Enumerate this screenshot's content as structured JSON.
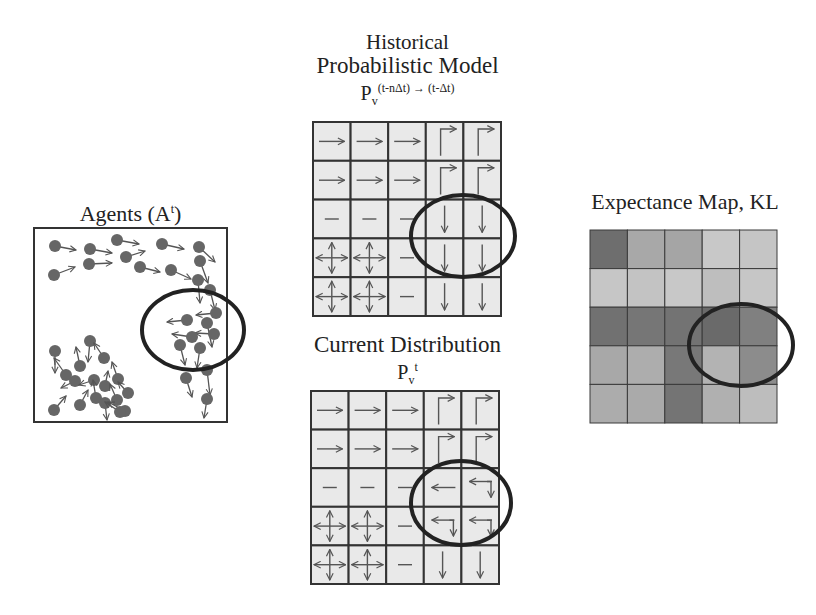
{
  "panels": {
    "agents": {
      "title": "Agents (A",
      "title_sup": "t",
      "title_close": ")"
    },
    "historical": {
      "title_line1": "Historical",
      "title_line2": "Probabilistic Model",
      "symbol": "P",
      "symbol_sub": "v",
      "symbol_sup": "(t-nΔt) → (t-Δt)"
    },
    "current": {
      "title_line1": "Current Distribution",
      "symbol": "P",
      "symbol_sub": "v",
      "symbol_sup": "t"
    },
    "expectance": {
      "title": "Expectance Map, KL"
    }
  },
  "colors": {
    "grid_cell": "#e9e9e9",
    "grid_line": "#333333",
    "arrow": "#555555",
    "agent": "#666666",
    "ellipse": "#222222"
  },
  "historical_grid": [
    [
      "right",
      "right",
      "right",
      "corner-down-right",
      "corner-down-right"
    ],
    [
      "right",
      "right",
      "right",
      "corner-down-right",
      "corner-down-right"
    ],
    [
      "none",
      "none",
      "none",
      "down",
      "down"
    ],
    [
      "all",
      "all",
      "none",
      "down",
      "down"
    ],
    [
      "all",
      "all",
      "none",
      "down",
      "down"
    ]
  ],
  "current_grid": [
    [
      "right",
      "right",
      "right",
      "corner-down-right",
      "corner-down-right"
    ],
    [
      "right",
      "right",
      "right",
      "corner-down-right",
      "corner-down-right"
    ],
    [
      "none",
      "none",
      "none",
      "left",
      "left-down"
    ],
    [
      "all",
      "all",
      "none",
      "left-down",
      "left-down"
    ],
    [
      "all",
      "all",
      "none",
      "down",
      "down"
    ]
  ],
  "kl_map": [
    [
      "#6e6e6e",
      "#a8a8a8",
      "#a5a5a5",
      "#c8c8c8",
      "#c5c5c5"
    ],
    [
      "#c6c6c6",
      "#c3c3c3",
      "#c8c8c8",
      "#bebebe",
      "#c6c6c6"
    ],
    [
      "#717171",
      "#767676",
      "#737373",
      "#6a6a6a",
      "#808080"
    ],
    [
      "#a8a8a8",
      "#adadad",
      "#787878",
      "#b3b3b3",
      "#8c8c8c"
    ],
    [
      "#acacac",
      "#aaaaaa",
      "#747474",
      "#b0b0b0",
      "#bdbdbd"
    ]
  ],
  "agents": [
    [
      55,
      246,
      76,
      250
    ],
    [
      90,
      249,
      112,
      253
    ],
    [
      117,
      240,
      139,
      244
    ],
    [
      162,
      244,
      184,
      249
    ],
    [
      199,
      247,
      215,
      262
    ],
    [
      54,
      275,
      75,
      267
    ],
    [
      89,
      264,
      112,
      263
    ],
    [
      126,
      257,
      145,
      251
    ],
    [
      140,
      267,
      160,
      272
    ],
    [
      171,
      270,
      191,
      279
    ],
    [
      200,
      261,
      208,
      283
    ],
    [
      198,
      280,
      200,
      303
    ],
    [
      210,
      290,
      215,
      310
    ],
    [
      216,
      313,
      196,
      315
    ],
    [
      187,
      320,
      167,
      322
    ],
    [
      207,
      323,
      212,
      347
    ],
    [
      214,
      334,
      195,
      333
    ],
    [
      192,
      337,
      172,
      334
    ],
    [
      180,
      345,
      185,
      365
    ],
    [
      200,
      348,
      197,
      368
    ],
    [
      207,
      370,
      210,
      395
    ],
    [
      186,
      378,
      192,
      397
    ],
    [
      207,
      399,
      204,
      418
    ],
    [
      90,
      341,
      88,
      362
    ],
    [
      55,
      351,
      55,
      373
    ],
    [
      66,
      375,
      54,
      358
    ],
    [
      80,
      366,
      76,
      347
    ],
    [
      104,
      358,
      94,
      343
    ],
    [
      75,
      381,
      61,
      388
    ],
    [
      94,
      380,
      79,
      385
    ],
    [
      105,
      386,
      108,
      371
    ],
    [
      118,
      379,
      112,
      362
    ],
    [
      96,
      398,
      93,
      380
    ],
    [
      105,
      403,
      107,
      420
    ],
    [
      117,
      400,
      110,
      384
    ],
    [
      80,
      405,
      88,
      390
    ],
    [
      54,
      410,
      66,
      396
    ],
    [
      125,
      411,
      108,
      402
    ],
    [
      128,
      393,
      118,
      382
    ],
    [
      120,
      412,
      105,
      402
    ]
  ]
}
